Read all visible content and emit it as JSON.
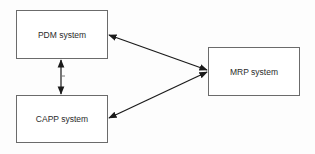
{
  "diagram": {
    "nodes": [
      {
        "id": "pdm",
        "label": "PDM system"
      },
      {
        "id": "capp",
        "label": "CAPP system"
      },
      {
        "id": "mrp",
        "label": "MRP system"
      }
    ],
    "edges": [
      {
        "from": "pdm",
        "to": "capp",
        "direction": "bidirectional"
      },
      {
        "from": "pdm",
        "to": "mrp",
        "direction": "bidirectional"
      },
      {
        "from": "capp",
        "to": "mrp",
        "direction": "bidirectional"
      }
    ],
    "colors": {
      "line": "#1a1a1a",
      "border": "#6b6b6b",
      "text": "#2a2a2a"
    }
  }
}
